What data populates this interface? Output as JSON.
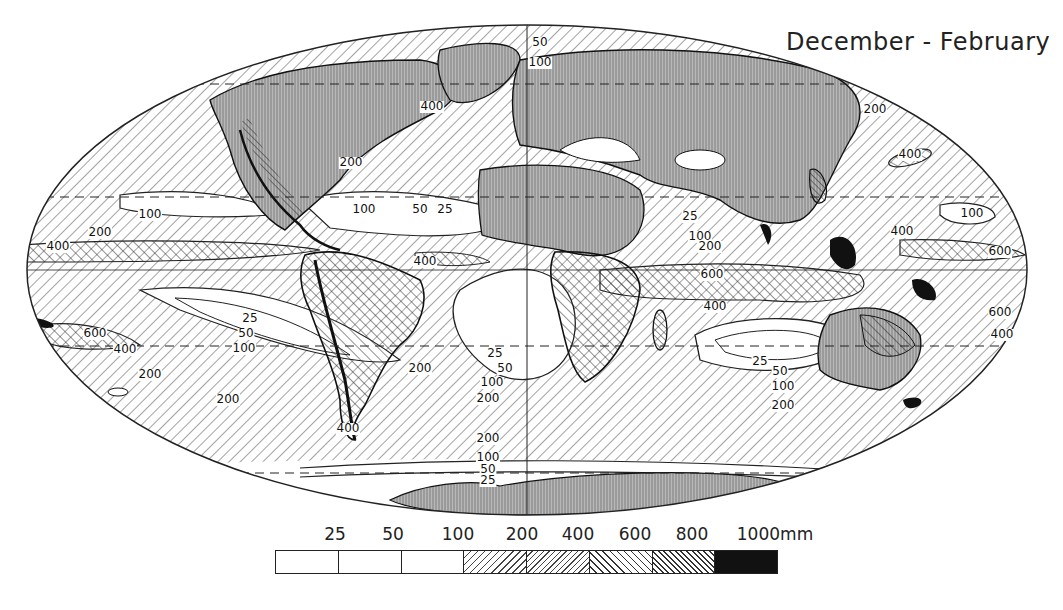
{
  "map": {
    "title": "December - February",
    "projection": "Mollweide (elliptical world)",
    "variable": "Seasonal precipitation",
    "contour_labels": [
      {
        "value": "50",
        "x": 540,
        "y": 46
      },
      {
        "value": "100",
        "x": 540,
        "y": 66
      },
      {
        "value": "400",
        "x": 432,
        "y": 110
      },
      {
        "value": "200",
        "x": 351,
        "y": 166
      },
      {
        "value": "200",
        "x": 875,
        "y": 113
      },
      {
        "value": "400",
        "x": 910,
        "y": 158
      },
      {
        "value": "100",
        "x": 150,
        "y": 218
      },
      {
        "value": "200",
        "x": 100,
        "y": 236
      },
      {
        "value": "400",
        "x": 58,
        "y": 250
      },
      {
        "value": "100",
        "x": 364,
        "y": 213
      },
      {
        "value": "50",
        "x": 420,
        "y": 213
      },
      {
        "value": "25",
        "x": 445,
        "y": 213
      },
      {
        "value": "400",
        "x": 425,
        "y": 265
      },
      {
        "value": "25",
        "x": 690,
        "y": 220
      },
      {
        "value": "100",
        "x": 700,
        "y": 240
      },
      {
        "value": "200",
        "x": 710,
        "y": 250
      },
      {
        "value": "600",
        "x": 712,
        "y": 278
      },
      {
        "value": "400",
        "x": 715,
        "y": 310
      },
      {
        "value": "100",
        "x": 972,
        "y": 217
      },
      {
        "value": "400",
        "x": 902,
        "y": 235
      },
      {
        "value": "600",
        "x": 1000,
        "y": 255
      },
      {
        "value": "600",
        "x": 1000,
        "y": 316
      },
      {
        "value": "400",
        "x": 1002,
        "y": 338
      },
      {
        "value": "25",
        "x": 250,
        "y": 322
      },
      {
        "value": "50",
        "x": 246,
        "y": 337
      },
      {
        "value": "100",
        "x": 244,
        "y": 352
      },
      {
        "value": "600",
        "x": 95,
        "y": 337
      },
      {
        "value": "400",
        "x": 125,
        "y": 353
      },
      {
        "value": "200",
        "x": 150,
        "y": 378
      },
      {
        "value": "200",
        "x": 228,
        "y": 403
      },
      {
        "value": "200",
        "x": 420,
        "y": 372
      },
      {
        "value": "25",
        "x": 495,
        "y": 357
      },
      {
        "value": "50",
        "x": 505,
        "y": 372
      },
      {
        "value": "100",
        "x": 492,
        "y": 386
      },
      {
        "value": "200",
        "x": 488,
        "y": 402
      },
      {
        "value": "400",
        "x": 348,
        "y": 432
      },
      {
        "value": "25",
        "x": 760,
        "y": 365
      },
      {
        "value": "50",
        "x": 780,
        "y": 375
      },
      {
        "value": "100",
        "x": 783,
        "y": 390
      },
      {
        "value": "200",
        "x": 783,
        "y": 409
      },
      {
        "value": "200",
        "x": 488,
        "y": 442
      },
      {
        "value": "100",
        "x": 488,
        "y": 461
      },
      {
        "value": "50",
        "x": 488,
        "y": 473
      },
      {
        "value": "25",
        "x": 488,
        "y": 484
      }
    ]
  },
  "legend": {
    "unit": "mm",
    "breaks": [
      "25",
      "50",
      "100",
      "200",
      "400",
      "600",
      "800",
      "1000mm"
    ],
    "classes": [
      {
        "range": "<25",
        "pattern": "blank"
      },
      {
        "range": "25-50",
        "pattern": "blank"
      },
      {
        "range": "50-100",
        "pattern": "blank"
      },
      {
        "range": "100-200",
        "pattern": "sparse diagonal hatch /"
      },
      {
        "range": "200-400",
        "pattern": "dense diagonal hatch /"
      },
      {
        "range": "400-600",
        "pattern": "diagonal hatch \\"
      },
      {
        "range": "600-800",
        "pattern": "dense diagonal hatch \\"
      },
      {
        "range": ">800",
        "pattern": "solid black"
      }
    ]
  },
  "colors": {
    "ink": "#1a1a1a",
    "paper": "#ffffff",
    "land_shade": "#9a9a9a"
  }
}
